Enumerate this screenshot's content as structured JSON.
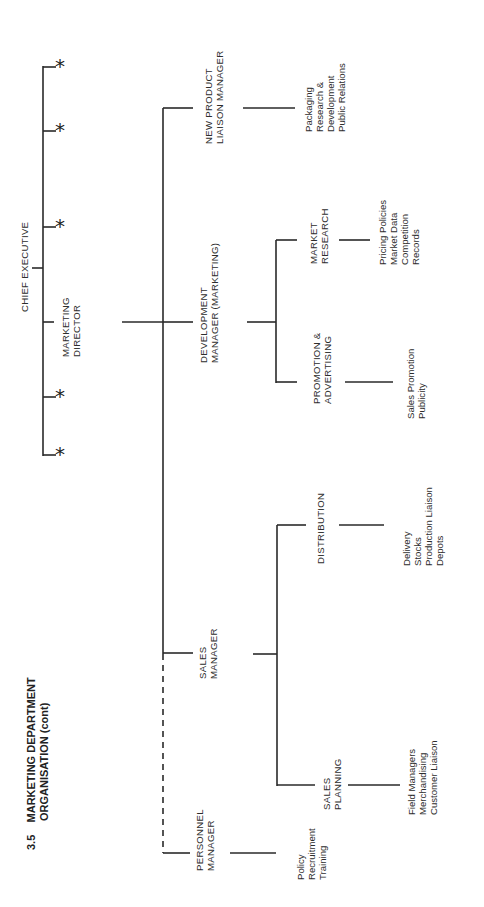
{
  "title": {
    "number": "3.5",
    "line1": "MARKETING DEPARTMENT",
    "line2": "ORGANISATION (cont)"
  },
  "chief_executive": {
    "label": "CHIEF EXECUTIVE",
    "other_reports_marker": "*",
    "other_reports_count": 5
  },
  "marketing_director": {
    "line1": "MARKETING",
    "line2": "DIRECTOR"
  },
  "managers": {
    "new_product": {
      "line1": "NEW PRODUCT",
      "line2": "LIAISON MANAGER",
      "duties": [
        "Packaging",
        "Research &",
        "Development",
        "Public Relations"
      ]
    },
    "development": {
      "line1": "DEVELOPMENT",
      "line2": "MANAGER (MARKETING)",
      "sub_units": {
        "market_research": {
          "line1": "MARKET",
          "line2": "RESEARCH",
          "duties": [
            "Pricing Policies",
            "Market Data",
            "Competition",
            "Records"
          ]
        },
        "promotion": {
          "line1": "PROMOTION &",
          "line2": "ADVERTISING",
          "duties": [
            "Sales Promotion",
            "Publicity"
          ]
        }
      }
    },
    "sales": {
      "line1": "SALES",
      "line2": "MANAGER",
      "sub_units": {
        "distribution": {
          "line1": "DISTRIBUTION",
          "duties": [
            "Delivery",
            "Stocks",
            "Production Liaison",
            "Depots"
          ]
        },
        "sales_planning": {
          "line1": "SALES",
          "line2": "PLANNING",
          "duties": [
            "Field Managers",
            "Merchandising",
            "Customer Liaison"
          ]
        }
      }
    },
    "personnel": {
      "line1": "PERSONNEL",
      "line2": "MANAGER",
      "relationship": "dotted-line",
      "duties": [
        "Policy",
        "Recruitment",
        "Training"
      ]
    }
  },
  "colors": {
    "ink": "#2a2a2a",
    "paper": "#ffffff"
  }
}
